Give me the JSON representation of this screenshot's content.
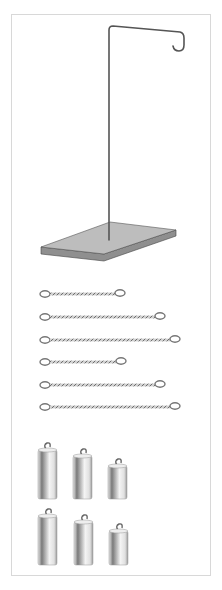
{
  "figure": {
    "colors": {
      "frame": "#d8d8d8",
      "rod": "#555555",
      "base_top": "#b9b9b9",
      "base_side": "#8f8f8f",
      "spring": "#8a8a8a",
      "weight_light": "#f2f2f2",
      "weight_dark": "#7a7a7a"
    }
  },
  "stand": {
    "label": "stand-with-hook"
  },
  "springs": [
    {
      "id": 1,
      "length_px": 75
    },
    {
      "id": 2,
      "length_px": 115
    },
    {
      "id": 3,
      "length_px": 130
    },
    {
      "id": 4,
      "length_px": 76
    },
    {
      "id": 5,
      "length_px": 115
    },
    {
      "id": 6,
      "length_px": 130
    }
  ],
  "weights": [
    {
      "id": 1,
      "row": 1,
      "size": "large"
    },
    {
      "id": 2,
      "row": 1,
      "size": "medium"
    },
    {
      "id": 3,
      "row": 1,
      "size": "small"
    },
    {
      "id": 4,
      "row": 2,
      "size": "large"
    },
    {
      "id": 5,
      "row": 2,
      "size": "medium"
    },
    {
      "id": 6,
      "row": 2,
      "size": "small"
    }
  ]
}
